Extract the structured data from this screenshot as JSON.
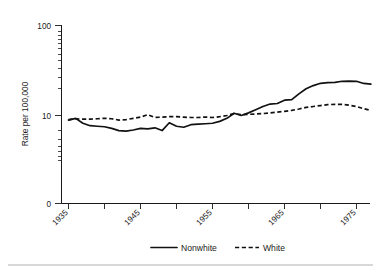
{
  "chart_data": {
    "type": "line",
    "title": "",
    "xlabel": "",
    "ylabel": "Rate per 100,000",
    "yscale": "log",
    "ylim": [
      5,
      100
    ],
    "xlim": [
      1935,
      1977
    ],
    "y_tick_labels": [
      "100",
      "10",
      "0"
    ],
    "y_tick_values": [
      100,
      10,
      0
    ],
    "x_tick_labels": [
      "1935",
      "1945",
      "1955",
      "1965",
      "1975"
    ],
    "x_tick_values": [
      1935,
      1945,
      1955,
      1965,
      1975
    ],
    "x_minor_ticks": [
      1940,
      1950,
      1960,
      1970
    ],
    "grid": false,
    "legend_position": "bottom",
    "series": [
      {
        "name": "Nonwhite",
        "style": "solid",
        "color": "#111111",
        "x": [
          1935,
          1936,
          1937,
          1938,
          1939,
          1940,
          1941,
          1942,
          1943,
          1944,
          1945,
          1946,
          1947,
          1948,
          1949,
          1950,
          1951,
          1952,
          1953,
          1954,
          1955,
          1956,
          1957,
          1958,
          1959,
          1960,
          1961,
          1962,
          1963,
          1964,
          1965,
          1966,
          1967,
          1968,
          1969,
          1970,
          1971,
          1972,
          1973,
          1974,
          1975,
          1976,
          1977
        ],
        "values": [
          8.9,
          9.3,
          8.2,
          7.7,
          7.6,
          7.5,
          7.2,
          6.8,
          6.7,
          6.9,
          7.2,
          7.1,
          7.3,
          6.8,
          8.3,
          7.6,
          7.4,
          7.9,
          8.0,
          8.1,
          8.2,
          8.6,
          9.3,
          10.6,
          10.0,
          10.7,
          11.6,
          12.6,
          13.4,
          13.6,
          14.8,
          15.0,
          17.4,
          19.8,
          21.5,
          22.8,
          23.2,
          23.3,
          24.0,
          24.1,
          24.0,
          22.7,
          22.3
        ]
      },
      {
        "name": "White",
        "style": "dashed",
        "color": "#111111",
        "x": [
          1935,
          1936,
          1937,
          1938,
          1939,
          1940,
          1941,
          1942,
          1943,
          1944,
          1945,
          1946,
          1947,
          1948,
          1949,
          1950,
          1951,
          1952,
          1953,
          1954,
          1955,
          1956,
          1957,
          1958,
          1959,
          1960,
          1961,
          1962,
          1963,
          1964,
          1965,
          1966,
          1967,
          1968,
          1969,
          1970,
          1971,
          1972,
          1973,
          1974,
          1975,
          1976,
          1977
        ],
        "values": [
          9.0,
          9.2,
          9.1,
          9.1,
          9.2,
          9.3,
          9.2,
          8.9,
          9.0,
          9.3,
          9.6,
          10.2,
          9.5,
          9.6,
          9.7,
          9.7,
          9.6,
          9.5,
          9.5,
          9.6,
          9.5,
          9.7,
          10.0,
          10.5,
          10.2,
          10.3,
          10.4,
          10.5,
          10.7,
          10.9,
          11.1,
          11.4,
          11.8,
          12.3,
          12.6,
          12.9,
          13.2,
          13.3,
          13.3,
          13.0,
          12.6,
          11.9,
          11.4
        ]
      }
    ],
    "legend": [
      {
        "label": "Nonwhite",
        "style": "solid"
      },
      {
        "label": "White",
        "style": "dashed"
      }
    ]
  },
  "colors": {
    "ink": "#111111",
    "axis": "#1a1a1a",
    "background": "#ffffff",
    "footer_rule": "#d8d8d8"
  }
}
